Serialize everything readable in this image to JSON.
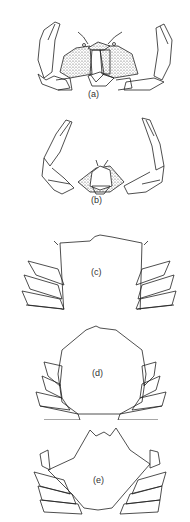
{
  "figure": {
    "panels": [
      {
        "id": "a",
        "label": "(a)",
        "description": "crab front view with chelipeds raised, stippled carapace regions"
      },
      {
        "id": "b",
        "label": "(b)",
        "description": "crab front view with elongated chelipeds spread wide"
      },
      {
        "id": "c",
        "label": "(c)",
        "description": "dorsal carapace, rectangular outline with walking legs"
      },
      {
        "id": "d",
        "label": "(d)",
        "description": "dorsal carapace, hexagonal rounded outline with walking legs"
      },
      {
        "id": "e",
        "label": "(e)",
        "description": "dorsal carapace, broad trapezoidal outline with walking legs"
      }
    ],
    "colors": {
      "line": "#222222",
      "stipple": "#555555",
      "background": "#ffffff"
    }
  }
}
